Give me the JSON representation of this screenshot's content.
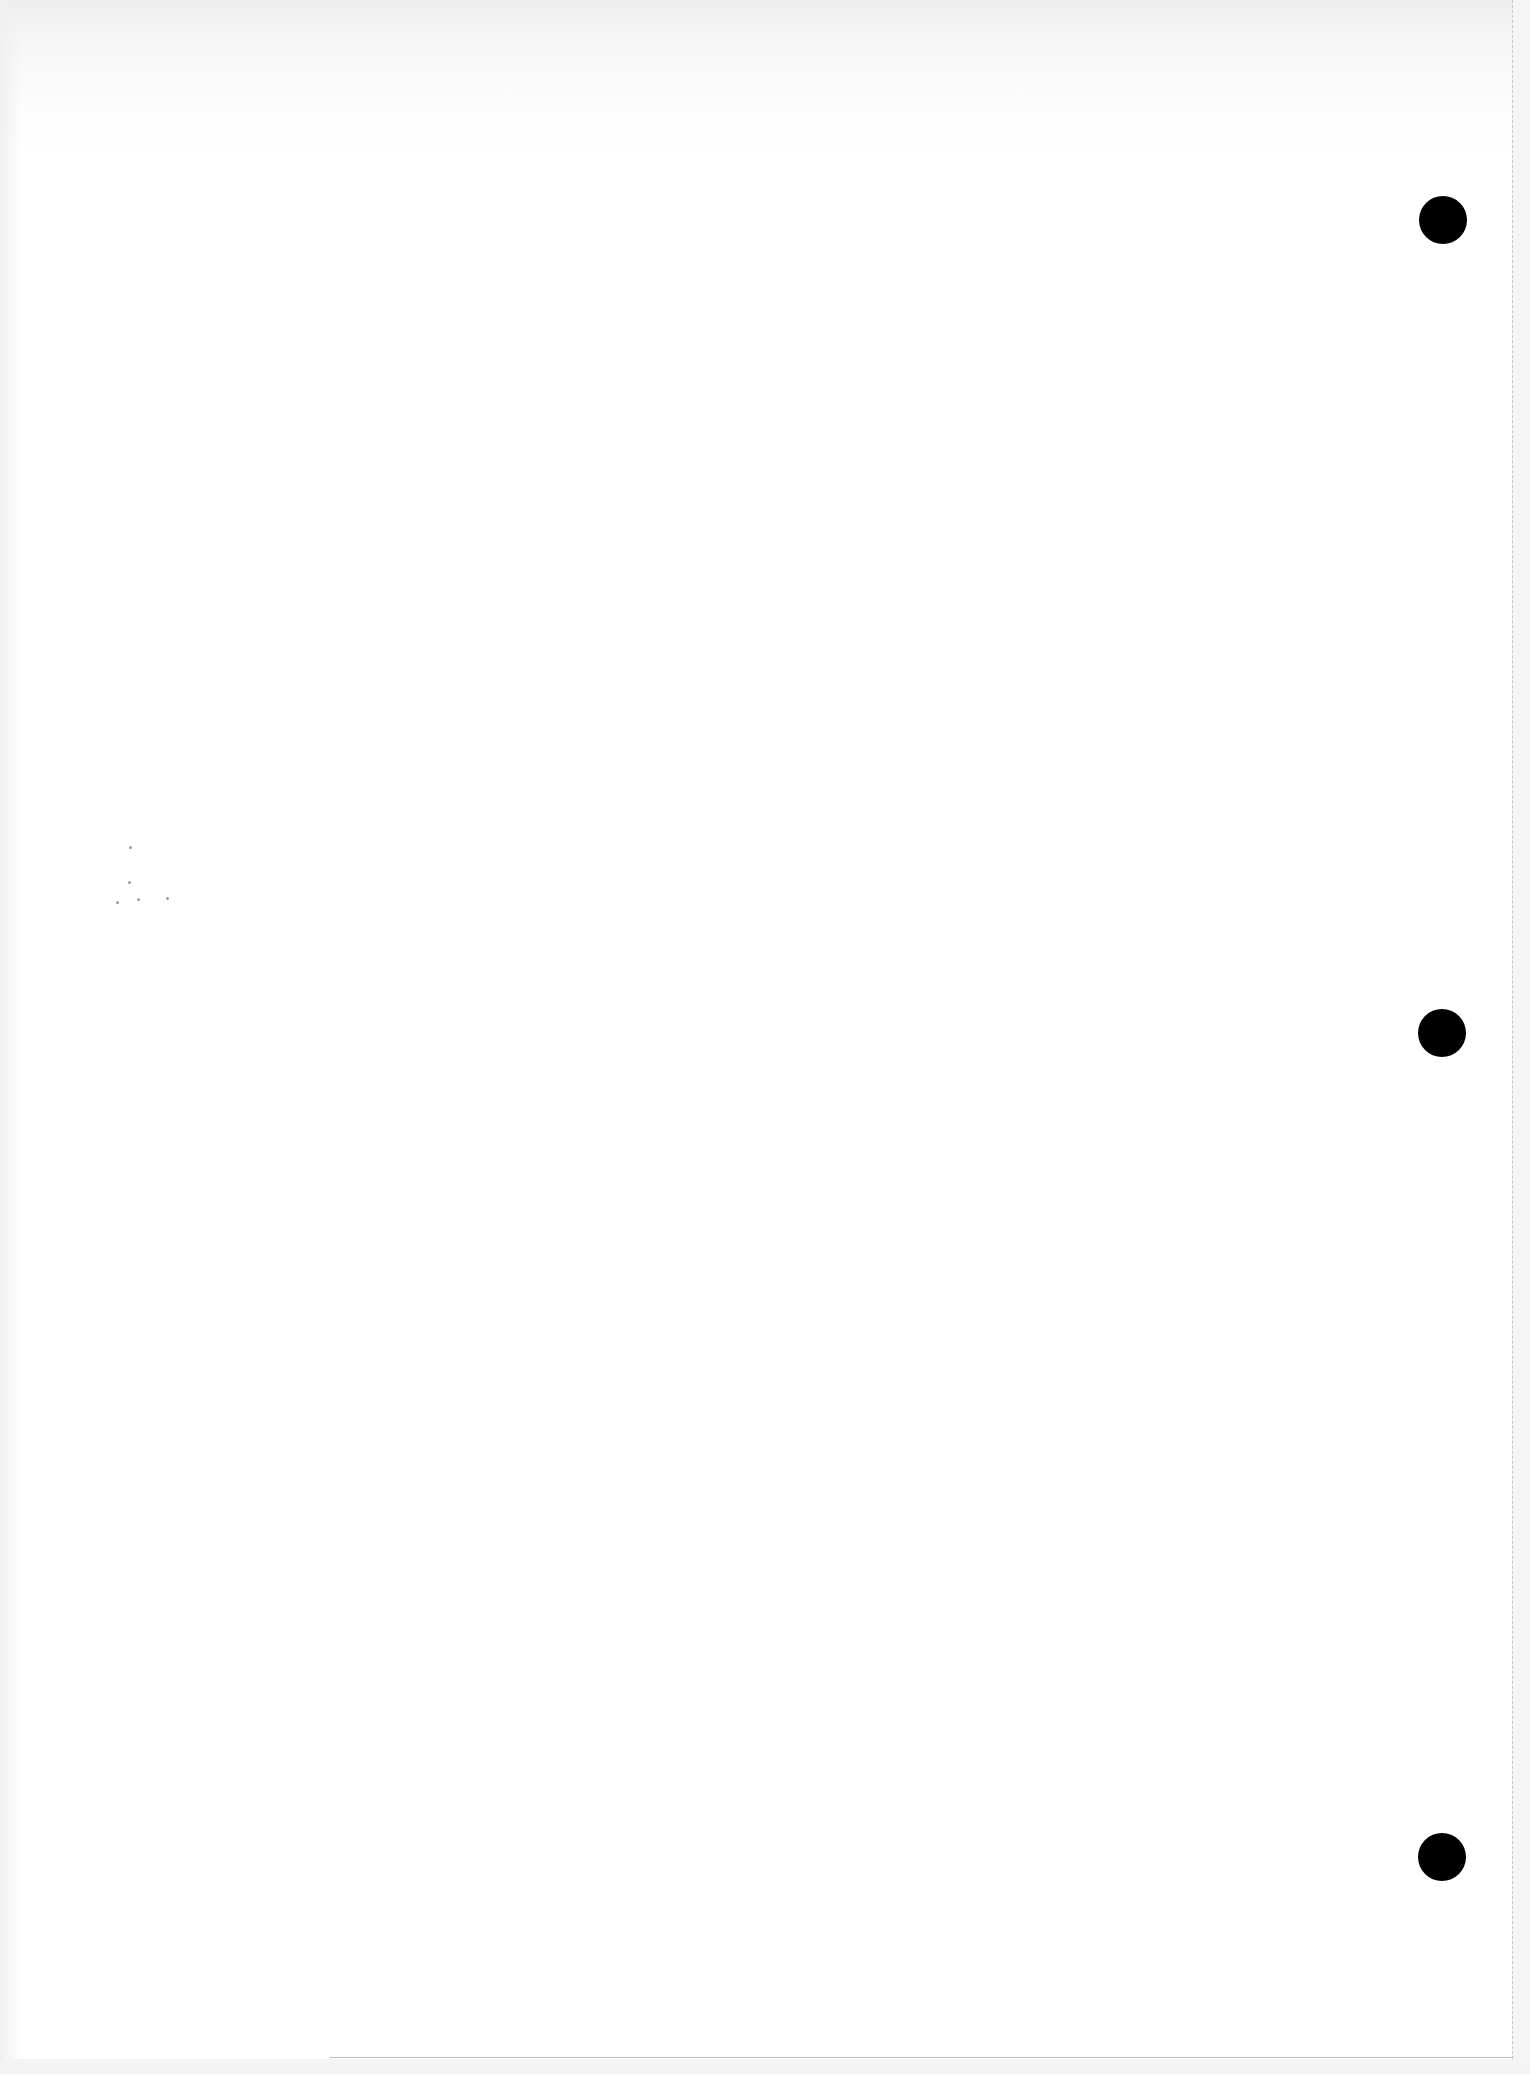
{
  "page": {
    "type": "blank-hole-punched-sheet",
    "background_color": "#ffffff",
    "holes": [
      {
        "name": "top",
        "cx": 1443,
        "cy": 220,
        "diameter": 48,
        "color": "#000000"
      },
      {
        "name": "middle",
        "cx": 1442,
        "cy": 1033,
        "diameter": 48,
        "color": "#000000"
      },
      {
        "name": "bottom",
        "cx": 1442,
        "cy": 1857,
        "diameter": 48,
        "color": "#000000"
      }
    ],
    "perforation_edge": {
      "side": "right",
      "x": 1512,
      "color": "#c4c4c4"
    },
    "bottom_edge": {
      "y": 2057,
      "x_start": 330,
      "x_end": 1512,
      "color": "#bdbdbd"
    },
    "specks": [
      {
        "x": 129,
        "y": 846
      },
      {
        "x": 128,
        "y": 881
      },
      {
        "x": 166,
        "y": 897
      },
      {
        "x": 116,
        "y": 901
      },
      {
        "x": 137,
        "y": 898
      }
    ]
  }
}
